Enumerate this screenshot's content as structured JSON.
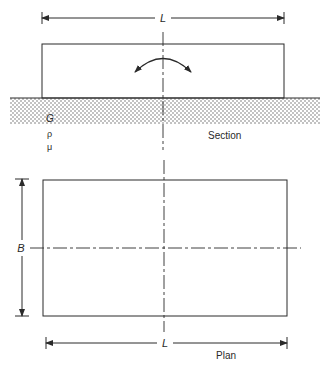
{
  "diagram": {
    "type": "foundation-geometry",
    "colors": {
      "line": "#2a2a2a",
      "background": "#ffffff",
      "soil_dots": "#555555"
    },
    "section": {
      "caption": "Section",
      "length_label": "L",
      "soil_properties": [
        "G",
        "ρ",
        "μ"
      ],
      "rotation_indicator": "rocking-arrow"
    },
    "plan": {
      "caption": "Plan",
      "length_label": "L",
      "width_label": "B"
    }
  }
}
